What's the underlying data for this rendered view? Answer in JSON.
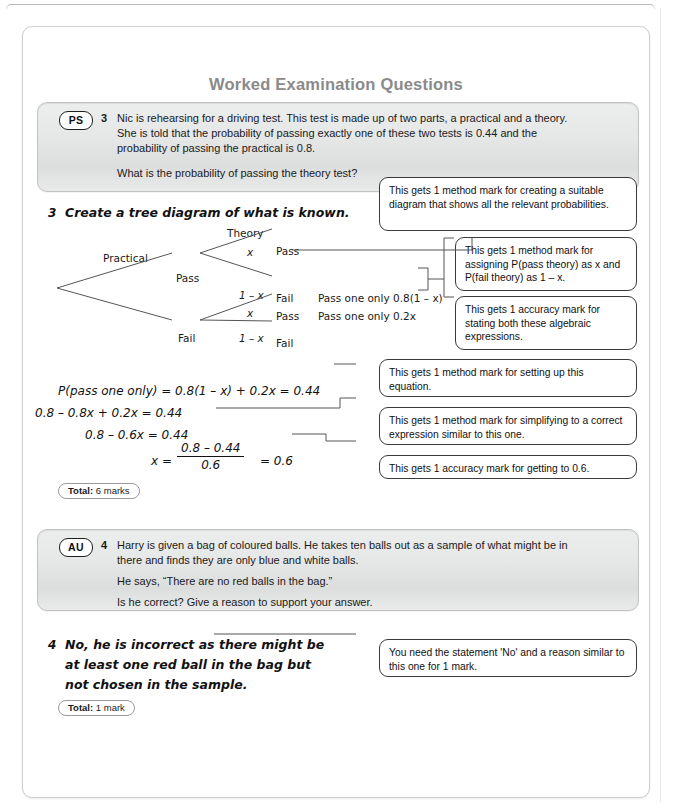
{
  "page": {
    "title": "Worked Examination Questions"
  },
  "questions": [
    {
      "badge": "PS",
      "number": "3",
      "lines": [
        "Nic is rehearsing for a driving test. This test is made up of two parts, a practical and a theory.",
        "She is told that the probability of passing exactly one of these two tests is 0.44 and the",
        "probability of passing the practical is 0.8."
      ],
      "question": "What is the probability of passing the theory test?"
    },
    {
      "badge": "AU",
      "number": "4",
      "lines": [
        "Harry is given a bag of coloured balls. He takes ten balls out as a sample of what might be in",
        "there and finds they are only blue and white balls."
      ],
      "quote": "He says, “There are no red balls in the bag.”",
      "question": "Is he correct? Give a reason to support your answer."
    }
  ],
  "answer3": {
    "number": "3",
    "heading": "Create a tree diagram of what is known.",
    "tree": {
      "col1_header": "Practical",
      "col2_header": "Theory",
      "node_pass": "Pass",
      "node_fail": "Fail",
      "leaf_pass_pass": "Pass",
      "leaf_pass_fail": "Fail",
      "leaf_fail_pass": "Pass",
      "leaf_fail_fail": "Fail",
      "prob_x_top": "x",
      "prob_1mx_top": "1 – x",
      "prob_x_bottom": "x",
      "prob_1mx_bottom": "1 – x",
      "outcome_top": "Pass one only 0.8(1 – x)",
      "outcome_bottom": "Pass one only 0.2x"
    },
    "equations": [
      "P(pass one only) = 0.8(1 – x) + 0.2x = 0.44",
      "0.8 – 0.8x + 0.2x = 0.44",
      "0.8 – 0.6x = 0.44"
    ],
    "final_equation": {
      "lhs": "x =",
      "numerator": "0.8 – 0.44",
      "denominator": "0.6",
      "rhs": "= 0.6"
    },
    "total_label": "Total:",
    "total_value": "6 marks",
    "notes": [
      "This gets 1 method mark for creating a suitable diagram that shows all the relevant probabilities.",
      "This gets 1 method mark for assigning P(pass theory) as x and P(fail theory) as 1 – x.",
      "This gets 1 accuracy mark for stating both these algebraic expressions.",
      "This gets 1 method mark for setting up this equation.",
      "This gets 1 method mark for simplifying to a correct expression similar to this one.",
      "This gets 1 accuracy mark for getting to 0.6."
    ]
  },
  "answer4": {
    "number": "4",
    "lines": [
      "No, he is incorrect as there might be",
      "at least one red ball in the bag but",
      "not chosen in the sample."
    ],
    "total_label": "Total:",
    "total_value": "1 mark",
    "note": "You need the statement 'No' and a reason similar to this one for 1 mark."
  },
  "colors": {
    "title": "#8a8a8a",
    "text": "#1a1a1a",
    "note_border": "#3a3a3a",
    "banner_bg": "#e6e7e7",
    "line": "#555555"
  }
}
